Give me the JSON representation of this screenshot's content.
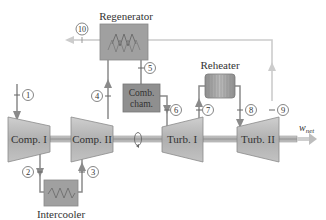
{
  "diagram": {
    "type": "gas-turbine-cycle-schematic",
    "components": {
      "regenerator": "Regenerator",
      "comb_chamber_line1": "Comb.",
      "comb_chamber_line2": "cham.",
      "reheater": "Reheater",
      "intercooler": "Intercooler",
      "comp1": "Comp. I",
      "comp2": "Comp. II",
      "turb1": "Turb. I",
      "turb2": "Turb. II"
    },
    "states": [
      "1",
      "2",
      "3",
      "4",
      "5",
      "6",
      "7",
      "8",
      "9",
      "10"
    ],
    "work_output": {
      "symbol": "w",
      "subscript": "net"
    },
    "colors": {
      "stream": "#8a8a8a",
      "exhaust_stream": "#c9c9c9",
      "machine_fill": "#b4b4b4",
      "heat_exchanger_fill": "#9e9e9e",
      "comb_chamber_fill": "#8f8f8f",
      "shaft": "#a8a8a8",
      "text": "#333333"
    }
  }
}
